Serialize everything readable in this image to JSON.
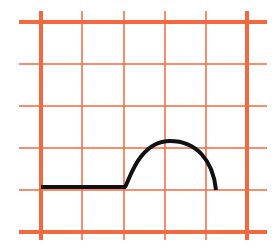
{
  "diagram": {
    "type": "grid-graph",
    "grid_color": "#f2683f",
    "curve_color": "#111111",
    "background": "#ffffff",
    "grid": {
      "vertical_lines": [
        {
          "x": 41,
          "thick": true
        },
        {
          "x": 82,
          "thick": false
        },
        {
          "x": 124,
          "thick": false
        },
        {
          "x": 165,
          "thick": false
        },
        {
          "x": 206,
          "thick": false
        },
        {
          "x": 247,
          "thick": true
        }
      ],
      "horizontal_lines": [
        {
          "y": 22,
          "thick": true
        },
        {
          "y": 64,
          "thick": false
        },
        {
          "y": 106,
          "thick": false
        },
        {
          "y": 148,
          "thick": false
        },
        {
          "y": 190,
          "thick": false
        },
        {
          "y": 232,
          "thick": true
        }
      ],
      "x_extent": [
        19,
        267
      ],
      "y_extent": [
        11,
        240
      ]
    },
    "curve": {
      "description": "Flat segment followed by a semicircular hump",
      "flat_segment": {
        "from": [
          41,
          187
        ],
        "to": [
          125,
          187
        ]
      },
      "hump": {
        "start": [
          125,
          187
        ],
        "apex": [
          170,
          141
        ],
        "end": [
          216,
          190
        ]
      }
    }
  }
}
